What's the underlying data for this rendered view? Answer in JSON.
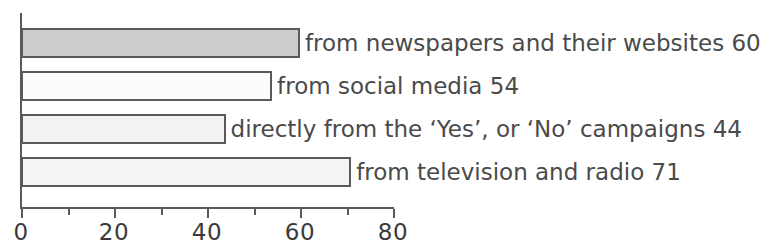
{
  "chart_data": {
    "type": "bar",
    "orientation": "horizontal",
    "title": "",
    "xlabel": "",
    "ylabel": "",
    "xlim": [
      0,
      80
    ],
    "grid": false,
    "legend": null,
    "categories": [
      "from newspapers and their websites",
      "from social media",
      "directly from the ‘Yes’, or ‘No’ campaigns",
      "from television and radio"
    ],
    "values": [
      60,
      54,
      44,
      71
    ],
    "bars": [
      {
        "label": "from newspapers and their websites 60",
        "category": "from newspapers and their websites",
        "value": 60,
        "fill": "#cdcdcd",
        "stroke": "#5a5a5a"
      },
      {
        "label": "from social media 54",
        "category": "from social media",
        "value": 54,
        "fill": "#fcfcfc",
        "stroke": "#5a5a5a"
      },
      {
        "label": "directly from the ‘Yes’, or ‘No’ campaigns 44",
        "category": "directly from the ‘Yes’, or ‘No’ campaigns",
        "value": 44,
        "fill": "#f2f2f2",
        "stroke": "#5a5a5a"
      },
      {
        "label": "from television and radio 71",
        "category": "from television and radio",
        "value": 71,
        "fill": "#f4f4f4",
        "stroke": "#5a5a5a"
      }
    ],
    "x_axis": {
      "major_ticks": [
        0,
        20,
        40,
        60,
        80
      ],
      "major_tick_labels": [
        "0",
        "20",
        "40",
        "60",
        "80"
      ],
      "minor_ticks": [
        10,
        30,
        50,
        70
      ]
    },
    "axis_color": "#5a5a5a",
    "text_color": "#4a4a4a"
  }
}
